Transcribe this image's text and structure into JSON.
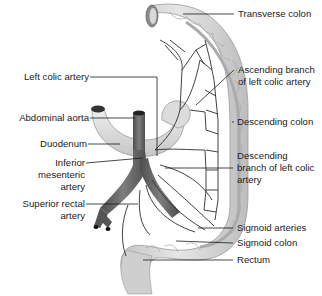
{
  "figure": {
    "type": "anatomical-diagram"
  },
  "labels_left": [
    {
      "id": "left-colic-artery",
      "text": "Left colic artery"
    },
    {
      "id": "abdominal-aorta",
      "text": "Abdominal aorta"
    },
    {
      "id": "duodenum",
      "text": "Duodenum"
    },
    {
      "id": "inferior-mesenteric-artery",
      "lines": [
        "Inferior",
        "mesenteric",
        "artery"
      ]
    },
    {
      "id": "superior-rectal-artery",
      "lines": [
        "Superior rectal",
        "artery"
      ]
    }
  ],
  "labels_right": [
    {
      "id": "transverse-colon",
      "text": "Transverse colon"
    },
    {
      "id": "ascending-branch",
      "lines": [
        "Ascending branch",
        "of left colic artery"
      ]
    },
    {
      "id": "descending-colon",
      "text": "Descending colon"
    },
    {
      "id": "descending-branch",
      "lines": [
        "Descending",
        "branch of left colic",
        "artery"
      ]
    },
    {
      "id": "sigmoid-arteries",
      "text": "Sigmoid arteries"
    },
    {
      "id": "sigmoid-colon",
      "text": "Sigmoid colon"
    },
    {
      "id": "rectum",
      "text": "Rectum"
    }
  ],
  "colors": {
    "colon_fill": "#d6d6d6",
    "colon_shade": "#b8b8b8",
    "artery": "#6a6a6a",
    "vessel_line": "#2a2a2a",
    "leader_line": "#1a1a1a"
  }
}
